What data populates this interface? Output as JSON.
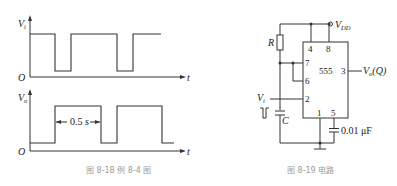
{
  "figure_left": {
    "caption": "图 8-18   例 8-4 图",
    "input_plot": {
      "y_label": "V",
      "y_label_sub": "i",
      "origin_label": "O",
      "x_label": "t"
    },
    "output_plot": {
      "y_label": "V",
      "y_label_sub": "o",
      "origin_label": "O",
      "x_label": "t",
      "annotation": "0.5 s"
    }
  },
  "figure_right": {
    "caption": "图 8-19   电路",
    "chip_label": "555",
    "supply_label": "V",
    "supply_label_sub": "DD",
    "output_label": "V",
    "output_label_sub": "o",
    "output_label_suffix": "(Q)",
    "input_label": "V",
    "input_label_sub": "i",
    "resistor_label": "R",
    "capacitor_label": "C",
    "control_cap_label": "0.01 μF",
    "pins": {
      "p4": "4",
      "p8": "8",
      "p7": "7",
      "p6": "6",
      "p2": "2",
      "p3": "3",
      "p1": "1",
      "p5": "5"
    }
  }
}
